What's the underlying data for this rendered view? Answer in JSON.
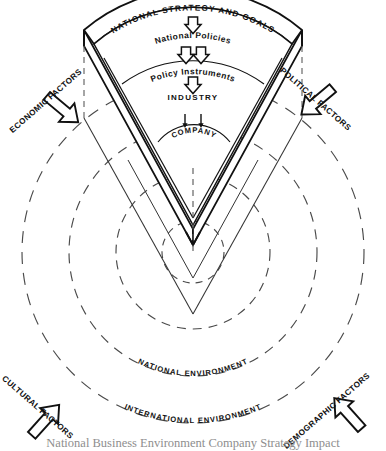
{
  "diagram": {
    "wedge": {
      "levels": [
        {
          "id": "national-strategy-and-goals",
          "label": "NATIONAL STRATEGY AND GOALS",
          "curved": true,
          "size": 8.2
        },
        {
          "id": "national-policies",
          "label": "National Policies",
          "curved": true,
          "size": 8.4
        },
        {
          "id": "policy-instruments",
          "label": "Policy Instruments",
          "curved": true,
          "size": 8.4
        },
        {
          "id": "industry",
          "label": "INDUSTRY",
          "curved": false,
          "size": 8.0
        },
        {
          "id": "company",
          "label": "COMPANY",
          "curved": true,
          "size": 7.6
        }
      ],
      "arrows": [
        {
          "id": "arrow-to-national-policies",
          "count": 1
        },
        {
          "id": "arrow-to-policy-instruments",
          "count": 2
        },
        {
          "id": "arrow-to-industry",
          "count": 1
        },
        {
          "id": "arrow-to-company",
          "count": 2
        }
      ]
    },
    "rings": [
      {
        "id": "ring-inner",
        "radius": 31,
        "label": ""
      },
      {
        "id": "ring-second",
        "radius": 77,
        "label": ""
      },
      {
        "id": "ring-national-environment",
        "radius": 124,
        "label": "NATIONAL ENVIRONMENT"
      },
      {
        "id": "ring-international-environment",
        "radius": 171,
        "label": "INTERNATIONAL ENVIRONMENT"
      }
    ],
    "external_factors": [
      {
        "id": "economic-factors",
        "label": "ECONOMIC FACTORS",
        "position": "top-left",
        "rotation": -41
      },
      {
        "id": "political-factors",
        "label": "POLITICAL FACTORS",
        "position": "top-right",
        "rotation": 41
      },
      {
        "id": "cultural-factors",
        "label": "CULTURAL FACTORS",
        "position": "bottom-left",
        "rotation": 41
      },
      {
        "id": "demographic-factors",
        "label": "DEMOGRAPHIC FACTORS",
        "position": "bottom-right",
        "rotation": -41
      }
    ],
    "caption": "National Business Environment Company Strategy Impact",
    "colors": {
      "ink": "#111111",
      "dashed": "#555555",
      "caption": "#8e8e8e",
      "background": "#ffffff"
    }
  }
}
